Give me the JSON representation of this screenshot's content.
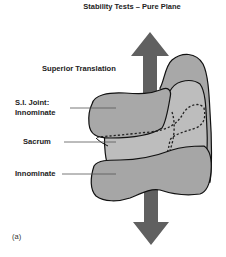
{
  "title": "Stability Tests – Pure Plane",
  "labels": {
    "superior_translation": "Superior Translation",
    "si_joint_line1": "S.I. Joint:",
    "si_joint_line2": "Innominate",
    "sacrum": "Sacrum",
    "innominate": "Innominate"
  },
  "panel_label": "(a)",
  "colors": {
    "arrow": "#606060",
    "back_shape": "#a8a8a8",
    "middle_shape": "#bdbdbd",
    "front_shape": "#a6a6a6",
    "outline": "#111111",
    "leader_line": "#555555"
  }
}
